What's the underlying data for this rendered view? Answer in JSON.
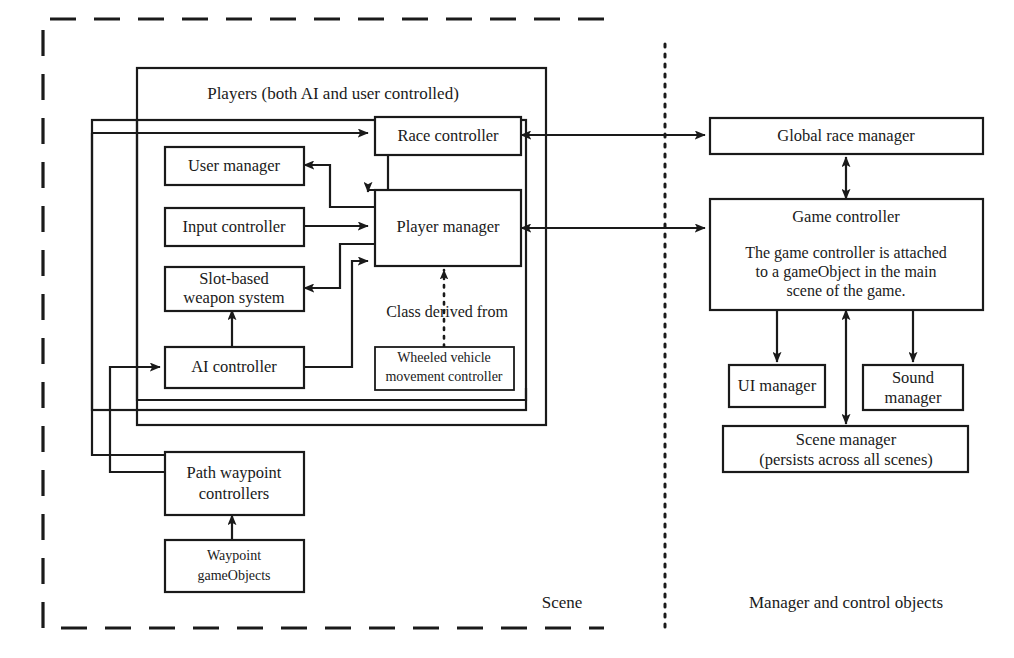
{
  "diagram": {
    "regions": [
      {
        "id": "scene",
        "label": "Scene",
        "border_style": "dashed"
      },
      {
        "id": "managers",
        "label": "Manager and control objects",
        "border_style": "none"
      }
    ],
    "divider": {
      "style": "dotted"
    },
    "groups": [
      {
        "id": "players-group",
        "label": "Players (both AI and user controlled)"
      }
    ],
    "nodes": {
      "race_controller": {
        "label": "Race controller"
      },
      "user_manager": {
        "label": "User manager"
      },
      "input_controller": {
        "label": "Input controller"
      },
      "slot_weapon": {
        "line1": "Slot-based",
        "line2": "weapon system"
      },
      "ai_controller": {
        "label": "AI controller"
      },
      "player_manager": {
        "label": "Player manager"
      },
      "wheeled_vehicle": {
        "line1": "Wheeled vehicle",
        "line2": "movement controller"
      },
      "path_waypoint": {
        "line1": "Path waypoint",
        "line2": "controllers"
      },
      "waypoint_gameobjects": {
        "line1": "Waypoint",
        "line2": "gameObjects"
      },
      "global_race_manager": {
        "label": "Global race manager"
      },
      "game_controller": {
        "title": "Game controller",
        "note_line1": "The game controller is attached",
        "note_line2": "to a gameObject in the main",
        "note_line3": "scene of the game."
      },
      "ui_manager": {
        "label": "UI manager"
      },
      "sound_manager": {
        "line1": "Sound",
        "line2": "manager"
      },
      "scene_manager": {
        "line1": "Scene manager",
        "line2": "(persists across all scenes)"
      }
    },
    "annotations": {
      "class_derived_from": "Class derived from"
    },
    "colors": {
      "stroke": "#1a1a1a",
      "fill": "#ffffff",
      "background": "#ffffff"
    }
  }
}
